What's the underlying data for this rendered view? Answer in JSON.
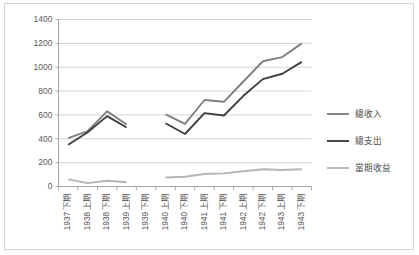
{
  "chart_data": {
    "type": "line",
    "title": "",
    "subtitle": "",
    "xlabel": "",
    "ylabel": "",
    "ylim": [
      0,
      1400
    ],
    "ytick_step": 200,
    "yticks": [
      "0",
      "200",
      "400",
      "600",
      "800",
      "1000",
      "1200",
      "1400"
    ],
    "grid": true,
    "legend_position": "right",
    "categories": [
      "1937 下期",
      "1938 上期",
      "1938 下期",
      "1939 上期",
      "1939 下期",
      "1940 上期",
      "1940 下期",
      "1941 上期",
      "1941 下期",
      "1942 上期",
      "1942 下期",
      "1943 上期",
      "1943 下期"
    ],
    "series": [
      {
        "name": "總收入",
        "color": "#808080",
        "width": 1.9,
        "values": [
          405,
          465,
          630,
          520,
          null,
          605,
          525,
          725,
          710,
          880,
          1050,
          1085,
          1200
        ]
      },
      {
        "name": "總支出",
        "color": "#3f3f3f",
        "width": 1.9,
        "values": [
          350,
          455,
          590,
          495,
          null,
          530,
          440,
          615,
          595,
          760,
          900,
          945,
          1045
        ]
      },
      {
        "name": "當期收益",
        "color": "#b5b5b5",
        "width": 1.9,
        "values": [
          60,
          28,
          48,
          35,
          null,
          75,
          82,
          105,
          110,
          128,
          145,
          138,
          145
        ]
      }
    ]
  },
  "legend": {
    "items": [
      {
        "label": "總收入"
      },
      {
        "label": "總支出"
      },
      {
        "label": "當期收益"
      }
    ]
  },
  "colors": {
    "frame_border": "#d4d4d4",
    "gridline": "#c9c9c9",
    "axis": "#9a9a9a",
    "tick_text": "#5a5a5a",
    "plot_background": "#ffffff"
  }
}
